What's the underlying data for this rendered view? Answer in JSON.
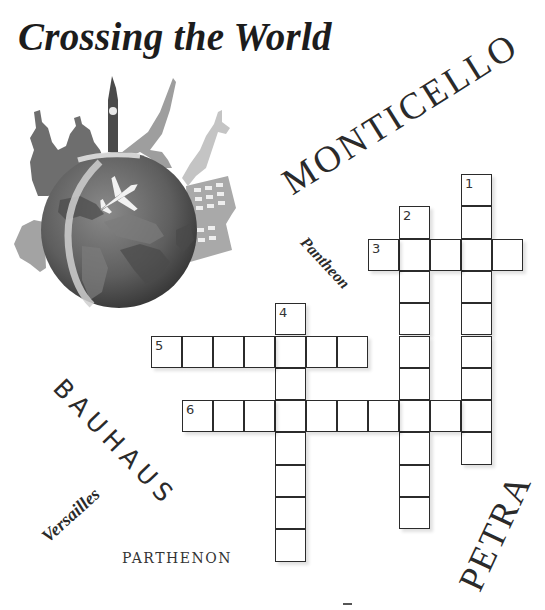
{
  "title": "Crossing the World",
  "illustration": {
    "description": "Globe with airplane surrounded by world landmarks",
    "landmarks": [
      "Saint Basil's Cathedral",
      "Big Ben",
      "Eiffel Tower",
      "Statue of Liberty",
      "Colosseum"
    ],
    "icon": "globe-landmarks-illustration"
  },
  "word_bank": [
    {
      "id": "monticello",
      "text": "MONTICELLO"
    },
    {
      "id": "pantheon",
      "text": "Pantheon"
    },
    {
      "id": "bauhaus",
      "text": "BAUHAUS"
    },
    {
      "id": "versailles",
      "text": "Versailles"
    },
    {
      "id": "parthenon",
      "text": "PARTHENON"
    },
    {
      "id": "petra",
      "text": "PETRA"
    }
  ],
  "crossword": {
    "cell_width": 31,
    "cell_height": 32.3,
    "origin_x": 151,
    "origin_y": 174,
    "entries": [
      {
        "number": "1",
        "direction": "down",
        "col": 10,
        "row": 0,
        "length": 9
      },
      {
        "number": "2",
        "direction": "down",
        "col": 8,
        "row": 1,
        "length": 10
      },
      {
        "number": "3",
        "direction": "across",
        "col": 7,
        "row": 2,
        "length": 5
      },
      {
        "number": "4",
        "direction": "down",
        "col": 4,
        "row": 4,
        "length": 8
      },
      {
        "number": "5",
        "direction": "across",
        "col": 0,
        "row": 5,
        "length": 7
      },
      {
        "number": "6",
        "direction": "across",
        "col": 1,
        "row": 7,
        "length": 10
      }
    ]
  },
  "colors": {
    "grid_border": "#2b2b2b",
    "text": "#222222",
    "background": "#ffffff"
  }
}
